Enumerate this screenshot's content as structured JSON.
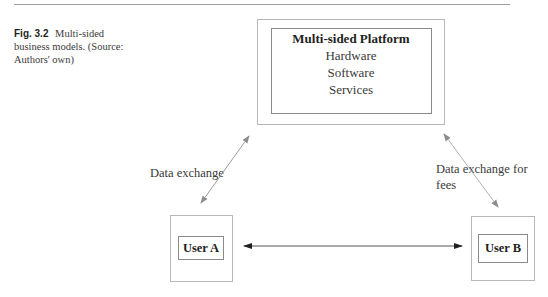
{
  "caption": {
    "figure_number": "Fig. 3.2",
    "text": "Multi-sided business models. (Source: Authors' own)"
  },
  "platform": {
    "title": "Multi-sided Platform",
    "items": [
      "Hardware",
      "Software",
      "Services"
    ]
  },
  "users": {
    "a": "User A",
    "b": "User B"
  },
  "edges": {
    "left_label": "Data exchange",
    "right_label_line1": "Data exchange for",
    "right_label_line2": "fees"
  }
}
